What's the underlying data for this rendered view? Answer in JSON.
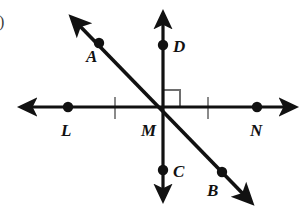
{
  "figure": {
    "kind": "geometry-diagram",
    "background_color": "#ffffff",
    "stroke_color": "#111111",
    "tick_color": "#8a8a8a",
    "right_angle_color": "#6e6e6e",
    "item_marker": ")",
    "labels": {
      "A": "A",
      "B": "B",
      "C": "C",
      "D": "D",
      "L": "L",
      "M": "M",
      "N": "N"
    },
    "points": [
      {
        "name": "A",
        "x": 99,
        "y": 43,
        "label_x": 86,
        "label_y": 62
      },
      {
        "name": "B",
        "x": 222,
        "y": 172,
        "label_x": 207,
        "label_y": 196
      },
      {
        "name": "C",
        "x": 163,
        "y": 170,
        "label_x": 173,
        "label_y": 177
      },
      {
        "name": "D",
        "x": 163,
        "y": 45,
        "label_x": 173,
        "label_y": 52
      },
      {
        "name": "L",
        "x": 68,
        "y": 107,
        "label_x": 61,
        "label_y": 136
      },
      {
        "name": "M",
        "x": 163,
        "y": 107,
        "label_x": 141,
        "label_y": 136
      },
      {
        "name": "N",
        "x": 257,
        "y": 107,
        "label_x": 250,
        "label_y": 136
      }
    ],
    "lines": [
      {
        "name": "line-LN-horizontal",
        "x1": 24,
        "y1": 107,
        "x2": 292,
        "y2": 107,
        "arrows": "both"
      },
      {
        "name": "line-DC-vertical",
        "x1": 163,
        "y1": 16,
        "x2": 163,
        "y2": 197,
        "arrows": "both"
      },
      {
        "name": "line-AB-diagonal",
        "x1": 74,
        "y1": 20,
        "x2": 249,
        "y2": 200,
        "arrows": "both"
      }
    ],
    "tick_marks": [
      {
        "name": "tick-left",
        "x": 115,
        "y1": 97,
        "y2": 119
      },
      {
        "name": "tick-right",
        "x": 208,
        "y1": 97,
        "y2": 119
      }
    ],
    "right_angle": {
      "name": "right-angle-marker",
      "corner_x": 163,
      "corner_y": 107,
      "size": 17,
      "quadrant": "upper-right"
    }
  }
}
